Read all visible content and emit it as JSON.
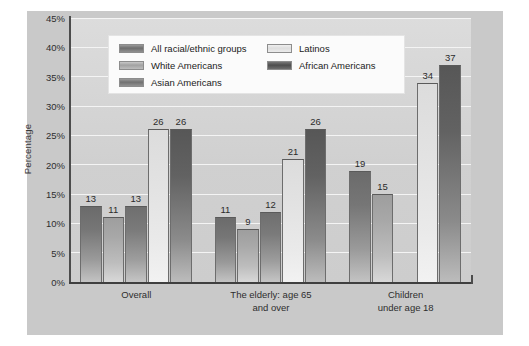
{
  "chart_data": {
    "type": "bar",
    "title": "",
    "subtitle": "",
    "xlabel": "",
    "ylabel": "Percentage",
    "ylim": [
      0,
      45
    ],
    "grid": true,
    "grid_axis": "y",
    "legend_position": "top-center-inside",
    "bar_orientation": "vertical",
    "group_spacing": true,
    "value_labels": true,
    "categories": [
      "Overall",
      "The elderly: age 65\nand over",
      "Children\nunder age 18"
    ],
    "ytick_labels": [
      "0%",
      "5%",
      "10%",
      "15%",
      "20%",
      "25%",
      "30%",
      "35%",
      "40%",
      "45%"
    ],
    "ytick_values": [
      0,
      5,
      10,
      15,
      20,
      25,
      30,
      35,
      40,
      45
    ],
    "series": [
      {
        "name": "All racial/ethnic groups",
        "color": "#767676",
        "values": [
          13,
          11,
          19
        ]
      },
      {
        "name": "White Americans",
        "color": "#a8a8a8",
        "values": [
          11,
          9,
          15
        ]
      },
      {
        "name": "Asian Americans",
        "color": "#7a7a7a",
        "values": [
          13,
          12,
          null
        ]
      },
      {
        "name": "Latinos",
        "color": "#e2e2e2",
        "values": [
          26,
          21,
          34
        ]
      },
      {
        "name": "African Americans",
        "color": "#626262",
        "values": [
          26,
          26,
          37
        ]
      }
    ],
    "bars": [
      {
        "group": 0,
        "series": 0,
        "label": "13",
        "value": 13
      },
      {
        "group": 0,
        "series": 1,
        "label": "11",
        "value": 11
      },
      {
        "group": 0,
        "series": 2,
        "label": "13",
        "value": 13
      },
      {
        "group": 0,
        "series": 3,
        "label": "26",
        "value": 26
      },
      {
        "group": 0,
        "series": 4,
        "label": "26",
        "value": 26
      },
      {
        "group": 1,
        "series": 0,
        "label": "11",
        "value": 11
      },
      {
        "group": 1,
        "series": 1,
        "label": "9",
        "value": 9
      },
      {
        "group": 1,
        "series": 2,
        "label": "12",
        "value": 12
      },
      {
        "group": 1,
        "series": 3,
        "label": "21",
        "value": 21
      },
      {
        "group": 1,
        "series": 4,
        "label": "26",
        "value": 26
      },
      {
        "group": 2,
        "series": 0,
        "label": "19",
        "value": 19
      },
      {
        "group": 2,
        "series": 1,
        "label": "15",
        "value": 15
      },
      {
        "group": 2,
        "series": 3,
        "label": "34",
        "value": 34
      },
      {
        "group": 2,
        "series": 4,
        "label": "37",
        "value": 37
      }
    ]
  },
  "legend": {
    "entries": [
      {
        "label": "All racial/ethnic groups",
        "series": 0,
        "column": 0,
        "row": 0
      },
      {
        "label": "White Americans",
        "series": 1,
        "column": 0,
        "row": 1
      },
      {
        "label": "Asian Americans",
        "series": 2,
        "column": 0,
        "row": 2
      },
      {
        "label": "Latinos",
        "series": 3,
        "column": 1,
        "row": 0
      },
      {
        "label": "African Americans",
        "series": 4,
        "column": 1,
        "row": 1
      }
    ]
  },
  "colors": {
    "panel_background": "#c9c9c9",
    "plot_background": "#d2d2d2",
    "gridline": "#f4f4f4",
    "axis": "#4c4c4c",
    "text": "#2e2e2e",
    "legend_background": "#fbfbfb"
  }
}
